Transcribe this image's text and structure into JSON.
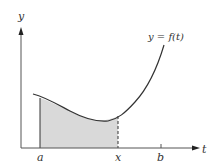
{
  "diagram": {
    "curve_label": "y = f(t)",
    "axes": {
      "x_label": "t",
      "y_label": "y"
    },
    "ticks": [
      {
        "label": "a",
        "position": "left bound of shaded region"
      },
      {
        "label": "x",
        "position": "right bound of shaded region (dashed)"
      },
      {
        "label": "b",
        "position": "tick on t-axis"
      }
    ],
    "shading": {
      "from": "a",
      "to": "x",
      "color": "#d9d9d9"
    },
    "colors": {
      "line": "#333333",
      "fill": "#d9d9d9"
    }
  },
  "labels": {
    "y_axis": "y",
    "t_axis": "t",
    "a": "a",
    "x": "x",
    "b": "b",
    "curve": "y = f(t)"
  }
}
